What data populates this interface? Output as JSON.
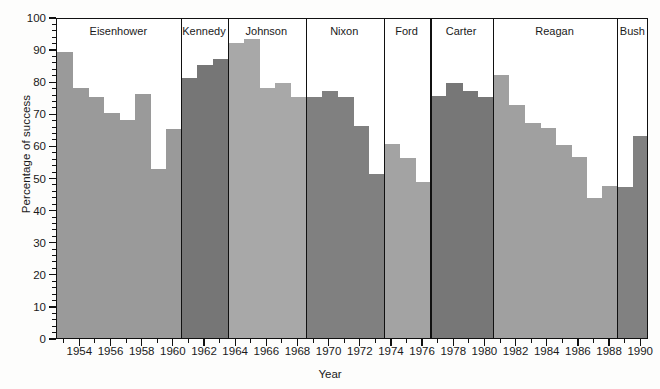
{
  "chart_data": {
    "type": "bar",
    "title": "",
    "xlabel": "Year",
    "ylabel": "Percentage of success",
    "xlim": [
      1952.5,
      1990.5
    ],
    "ylim": [
      0,
      100
    ],
    "yticks": [
      0,
      10,
      20,
      30,
      40,
      50,
      60,
      70,
      80,
      90,
      100
    ],
    "xticks": [
      1954,
      1956,
      1958,
      1960,
      1962,
      1964,
      1966,
      1968,
      1970,
      1972,
      1974,
      1976,
      1978,
      1980,
      1982,
      1984,
      1986,
      1988,
      1990
    ],
    "xtick_labels": [
      "1954",
      "1956",
      "1958",
      "1960",
      "1962",
      "1964",
      "1966",
      "1968",
      "1970",
      "1972",
      "1974",
      "1976",
      "1978",
      "1980",
      "1982",
      "1984",
      "1986",
      "1988",
      "1990"
    ],
    "grid": false,
    "legend": "none",
    "minor_ticks": true,
    "categories": [
      1953,
      1954,
      1955,
      1956,
      1957,
      1958,
      1959,
      1960,
      1961,
      1962,
      1963,
      1964,
      1965,
      1966,
      1967,
      1968,
      1969,
      1970,
      1971,
      1972,
      1973,
      1974,
      1975,
      1976,
      1977,
      1978,
      1979,
      1980,
      1981,
      1982,
      1983,
      1984,
      1985,
      1986,
      1987,
      1988,
      1989,
      1990
    ],
    "values": [
      89,
      78,
      75,
      70,
      68,
      76,
      52.5,
      65,
      81,
      85,
      87,
      92,
      93,
      78,
      79.5,
      75,
      75,
      77,
      75,
      66,
      51,
      60.5,
      56,
      48.5,
      75.5,
      79.5,
      77,
      75,
      82,
      72.5,
      67,
      65.5,
      60,
      56.5,
      43.5,
      47.5,
      47,
      63
    ],
    "bar_groups": [
      {
        "president": "Eisenhower",
        "start_year": 1953,
        "end_year": 1960,
        "shade": "#9a9a9a",
        "values": [
          89,
          78,
          75,
          70,
          68,
          76,
          52.5,
          65
        ]
      },
      {
        "president": "Kennedy",
        "start_year": 1961,
        "end_year": 1963,
        "shade": "#767676",
        "values": [
          81,
          85,
          87
        ]
      },
      {
        "president": "Johnson",
        "start_year": 1964,
        "end_year": 1968,
        "shade": "#a8a8a8",
        "values": [
          92,
          93,
          78,
          79.5,
          75
        ]
      },
      {
        "president": "Nixon",
        "start_year": 1969,
        "end_year": 1973,
        "shade": "#808080",
        "values": [
          75,
          77,
          75,
          66,
          51
        ]
      },
      {
        "president": "Ford",
        "start_year": 1974,
        "end_year": 1976,
        "shade": "#a3a3a3",
        "values": [
          60.5,
          56,
          48.5
        ]
      },
      {
        "president": "Carter",
        "start_year": 1977,
        "end_year": 1980,
        "shade": "#777777",
        "values": [
          75.5,
          79.5,
          77,
          75
        ]
      },
      {
        "president": "Reagan",
        "start_year": 1981,
        "end_year": 1988,
        "shade": "#a0a0a0",
        "values": [
          82,
          72.5,
          67,
          65.5,
          60,
          56.5,
          43.5,
          47.5
        ]
      },
      {
        "president": "Bush",
        "start_year": 1989,
        "end_year": 1990,
        "shade": "#818181",
        "values": [
          47,
          63
        ]
      }
    ],
    "president_labels": [
      "Eisenhower",
      "Kennedy",
      "Johnson",
      "Nixon",
      "Ford",
      "Carter",
      "Reagan",
      "Bush"
    ],
    "colors": {
      "axis": "#111111",
      "text": "#1a1a1a",
      "background": "#fdfdfc",
      "plot_background": "#ffffff"
    }
  }
}
